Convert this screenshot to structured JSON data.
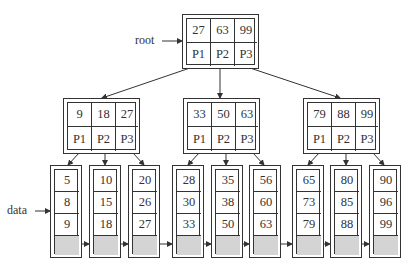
{
  "labels": {
    "root": "root",
    "data": "data"
  },
  "root": {
    "keys": [
      "27",
      "63",
      "99"
    ],
    "pointers": [
      "P1",
      "P2",
      "P3"
    ]
  },
  "internal": [
    {
      "keys": [
        "9",
        "18",
        "27"
      ],
      "pointers": [
        "P1",
        "P2",
        "P3"
      ]
    },
    {
      "keys": [
        "33",
        "50",
        "63"
      ],
      "pointers": [
        "P1",
        "P2",
        "P3"
      ]
    },
    {
      "keys": [
        "79",
        "88",
        "99"
      ],
      "pointers": [
        "P1",
        "P2",
        "P3"
      ]
    }
  ],
  "leaves": [
    {
      "values": [
        "5",
        "8",
        "9"
      ]
    },
    {
      "values": [
        "10",
        "15",
        "18"
      ]
    },
    {
      "values": [
        "20",
        "26",
        "27"
      ]
    },
    {
      "values": [
        "28",
        "30",
        "33"
      ]
    },
    {
      "values": [
        "35",
        "38",
        "50"
      ]
    },
    {
      "values": [
        "56",
        "60",
        "63"
      ]
    },
    {
      "values": [
        "65",
        "73",
        "79"
      ]
    },
    {
      "values": [
        "80",
        "85",
        "88"
      ]
    },
    {
      "values": [
        "90",
        "96",
        "99"
      ]
    }
  ],
  "colors": {
    "line": "#333333",
    "shaded_cell": "#d4d4d4"
  }
}
